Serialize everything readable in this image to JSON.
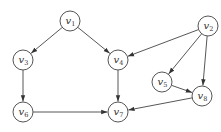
{
  "diagram": {
    "type": "directed-graph",
    "node_radius": 10,
    "colors": {
      "stroke": "#555555",
      "fill": "#ffffff",
      "text": "#333333",
      "edge": "#444444"
    },
    "nodes": [
      {
        "id": "v1",
        "label": "v",
        "sub": "1",
        "x": 70,
        "y": 21
      },
      {
        "id": "v2",
        "label": "v",
        "sub": "2",
        "x": 208,
        "y": 26
      },
      {
        "id": "v3",
        "label": "v",
        "sub": "3",
        "x": 23,
        "y": 60
      },
      {
        "id": "v4",
        "label": "v",
        "sub": "4",
        "x": 118,
        "y": 60
      },
      {
        "id": "v5",
        "label": "v",
        "sub": "5",
        "x": 162,
        "y": 82
      },
      {
        "id": "v6",
        "label": "v",
        "sub": "6",
        "x": 23,
        "y": 112
      },
      {
        "id": "v7",
        "label": "v",
        "sub": "7",
        "x": 118,
        "y": 112
      },
      {
        "id": "v8",
        "label": "v",
        "sub": "8",
        "x": 202,
        "y": 96
      }
    ],
    "edges": [
      {
        "from": "v1",
        "to": "v3"
      },
      {
        "from": "v1",
        "to": "v4"
      },
      {
        "from": "v2",
        "to": "v4"
      },
      {
        "from": "v2",
        "to": "v5"
      },
      {
        "from": "v2",
        "to": "v8"
      },
      {
        "from": "v3",
        "to": "v6"
      },
      {
        "from": "v4",
        "to": "v7"
      },
      {
        "from": "v6",
        "to": "v7"
      },
      {
        "from": "v5",
        "to": "v8"
      },
      {
        "from": "v8",
        "to": "v7"
      }
    ]
  }
}
